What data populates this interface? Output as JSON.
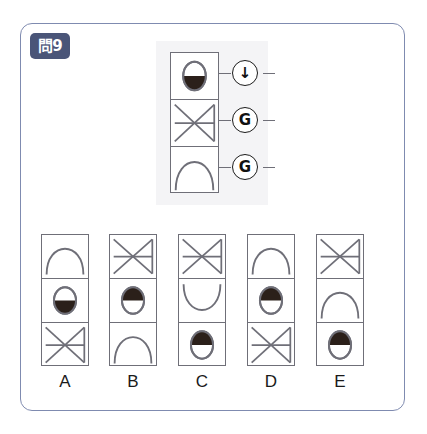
{
  "badge": {
    "label": "問9"
  },
  "colors": {
    "frame_border": "#7f8bb0",
    "badge_bg": "#4a5578",
    "cell_border": "#6f6f78",
    "shape_stroke": "#6f6f78",
    "fill_dark": "#2b201a",
    "stimulus_bg": "#f4f4f6"
  },
  "stimulus": {
    "name": "stimulus-sequence",
    "cells": [
      {
        "shape": "egg-bottom-filled",
        "description": "oval with lower half filled dark"
      },
      {
        "shape": "bowtie-x",
        "description": "X cross with horizontal bar and right vertical bar"
      },
      {
        "shape": "arch",
        "description": "dome arch opening downward"
      }
    ],
    "operators": [
      {
        "symbol": "↓",
        "name": "down-arrow-operator"
      },
      {
        "symbol": "G",
        "name": "g-operator"
      },
      {
        "symbol": "G",
        "name": "g-operator"
      }
    ]
  },
  "options": [
    {
      "label": "A",
      "cells": [
        {
          "shape": "arch"
        },
        {
          "shape": "egg-bottom-filled"
        },
        {
          "shape": "bowtie-x"
        }
      ]
    },
    {
      "label": "B",
      "cells": [
        {
          "shape": "bowtie-x"
        },
        {
          "shape": "egg-top-filled"
        },
        {
          "shape": "arch"
        }
      ]
    },
    {
      "label": "C",
      "cells": [
        {
          "shape": "bowtie-x"
        },
        {
          "shape": "arch-inverted"
        },
        {
          "shape": "egg-top-filled"
        }
      ]
    },
    {
      "label": "D",
      "cells": [
        {
          "shape": "arch"
        },
        {
          "shape": "egg-top-filled"
        },
        {
          "shape": "bowtie-x"
        }
      ]
    },
    {
      "label": "E",
      "cells": [
        {
          "shape": "bowtie-x"
        },
        {
          "shape": "arch"
        },
        {
          "shape": "egg-top-filled"
        }
      ]
    }
  ]
}
